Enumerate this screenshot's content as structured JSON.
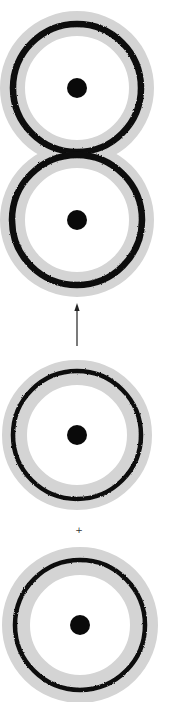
{
  "figure": {
    "background": "#ffffff",
    "colors": {
      "halo": "#d4d4d4",
      "ring": "#111111",
      "dot": "#0a0a0a",
      "arrow": "#222222",
      "plus": "#333333"
    },
    "rings": [
      {
        "id": "ring-1",
        "cx": 77,
        "cy": 88,
        "halo_outer": 77,
        "halo_inner": 52,
        "ring_r": 64,
        "ring_w": 6.5,
        "dot_r": 10
      },
      {
        "id": "ring-2",
        "cx": 77,
        "cy": 220,
        "halo_outer": 77,
        "halo_inner": 52,
        "ring_r": 65,
        "ring_w": 6.5,
        "dot_r": 10
      },
      {
        "id": "ring-3",
        "cx": 77,
        "cy": 435,
        "halo_outer": 75,
        "halo_inner": 50,
        "ring_r": 64,
        "ring_w": 4.5,
        "dot_r": 10
      },
      {
        "id": "ring-4",
        "cx": 80,
        "cy": 625,
        "halo_outer": 78,
        "halo_inner": 50,
        "ring_r": 65,
        "ring_w": 4.5,
        "dot_r": 10
      }
    ],
    "arrow": {
      "x": 77,
      "y_start": 346,
      "y_end": 303,
      "direction": "up"
    },
    "plus": {
      "x": 79,
      "y": 530,
      "symbol": "+"
    }
  }
}
